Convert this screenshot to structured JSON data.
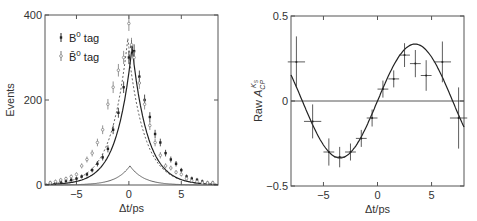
{
  "chart_data": [
    {
      "type": "scatter",
      "title": "",
      "xlabel": "Δt/ps",
      "ylabel": "Events",
      "xlim": [
        -8,
        8.5
      ],
      "ylim": [
        0,
        400
      ],
      "xticks": [
        "-5",
        "0",
        "5"
      ],
      "yticks": [
        "0",
        "200",
        "400"
      ],
      "legend": [
        "B⁰ tag",
        "B̄⁰ tag"
      ],
      "legend_position": "upper-left",
      "grid": false,
      "series": [
        {
          "name": "B0 tag",
          "style": "filled points, solid fit curve",
          "x": [
            -7.5,
            -7,
            -6.5,
            -6,
            -5.5,
            -5,
            -4.5,
            -4,
            -3.5,
            -3,
            -2.5,
            -2,
            -1.5,
            -1,
            -0.5,
            0,
            0.25,
            0.5,
            1,
            1.5,
            2,
            2.5,
            3,
            3.5,
            4,
            4.5,
            5,
            5.5,
            6,
            6.5,
            7,
            7.5,
            8
          ],
          "y": [
            5,
            5,
            8,
            10,
            12,
            15,
            20,
            25,
            35,
            50,
            65,
            85,
            130,
            170,
            230,
            300,
            325,
            315,
            255,
            200,
            160,
            120,
            100,
            75,
            60,
            50,
            35,
            20,
            15,
            12,
            8,
            5,
            5
          ]
        },
        {
          "name": "B0bar tag",
          "style": "open points, dashed fit curve",
          "x": [
            -7.5,
            -7,
            -6.5,
            -6,
            -5.5,
            -5,
            -4.5,
            -4,
            -3.5,
            -3,
            -2.5,
            -2,
            -1.5,
            -1,
            -0.5,
            0,
            0.25,
            0.5,
            1,
            1.5,
            2,
            2.5,
            3,
            3.5,
            4,
            4.5,
            5,
            5.5,
            6,
            6.5,
            7,
            7.5,
            8
          ],
          "y": [
            5,
            8,
            12,
            15,
            20,
            25,
            45,
            60,
            75,
            100,
            130,
            190,
            230,
            270,
            300,
            380,
            330,
            300,
            240,
            190,
            140,
            100,
            70,
            45,
            40,
            30,
            25,
            15,
            10,
            8,
            5,
            5,
            5
          ]
        },
        {
          "name": "background",
          "style": "solid curve",
          "peak_x": 0,
          "peak_y": 45
        }
      ]
    },
    {
      "type": "scatter",
      "title": "",
      "xlabel": "Δt/ps",
      "ylabel": "Raw A_CP^{K_S}",
      "xlim": [
        -8,
        8
      ],
      "ylim": [
        -0.5,
        0.5
      ],
      "xticks": [
        "-5",
        "0",
        "5"
      ],
      "yticks": [
        "-0.5",
        "0",
        "0.5"
      ],
      "grid": false,
      "series": [
        {
          "name": "data",
          "x": [
            -7.5,
            -6,
            -4.5,
            -3.5,
            -2.5,
            -1.5,
            -0.5,
            0.5,
            1.5,
            2.5,
            3.5,
            4.5,
            6,
            7.5
          ],
          "y": [
            0.23,
            -0.12,
            -0.3,
            -0.33,
            -0.3,
            -0.22,
            -0.1,
            0.07,
            0.13,
            0.27,
            0.22,
            0.15,
            0.23,
            -0.1
          ],
          "yerr": [
            0.15,
            0.1,
            0.08,
            0.06,
            0.05,
            0.05,
            0.05,
            0.05,
            0.05,
            0.07,
            0.08,
            0.09,
            0.12,
            0.18
          ]
        },
        {
          "name": "fit",
          "style": "solid sine curve",
          "amplitude": 0.34,
          "zero_line": 0
        }
      ]
    }
  ]
}
